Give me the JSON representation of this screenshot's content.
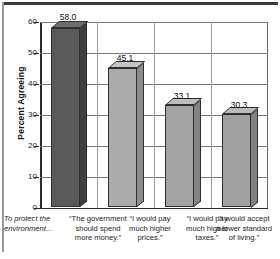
{
  "chart_data": {
    "type": "bar",
    "title": "",
    "xlabel": "",
    "ylabel": "Percent Agreeing",
    "ylim": [
      0,
      60
    ],
    "yticks": [
      0,
      10,
      20,
      30,
      40,
      50,
      60
    ],
    "grid": true,
    "legend": "none",
    "lead_in_label": "To protect the environment…",
    "categories": [
      "“The government should spend more money.”",
      "“I would pay much higher prices.”",
      "“I would pay much higher taxes.”",
      "“I would accept a lower standard of living.”"
    ],
    "category_lines": [
      [
        "“The government",
        "should spend",
        "more money.”"
      ],
      [
        "“I would pay",
        "much higher",
        "prices.”"
      ],
      [
        "“I would pay",
        "much higher",
        "taxes.”"
      ],
      [
        "“I would accept",
        "a lower standard",
        "of living.”"
      ]
    ],
    "lead_in_lines": [
      "To protect the",
      "environment…"
    ],
    "values": [
      58.0,
      45.1,
      33.1,
      30.3
    ],
    "value_labels": [
      "58.0",
      "45.1",
      "33.1",
      "30.3"
    ],
    "bar_colors": [
      "#595959",
      "#ababab",
      "#a3a3a3",
      "#a0a0a0"
    ],
    "bar_top_colors": [
      "#6e6e6e",
      "#c4c4c4",
      "#bdbdbd",
      "#bababa"
    ],
    "bar_side_colors": [
      "#3f3f3f",
      "#8c8c8c",
      "#848484",
      "#818181"
    ]
  },
  "axis": {
    "tick_labels": [
      "60",
      "50",
      "40",
      "30",
      "20",
      "10",
      "0"
    ]
  },
  "colors": {
    "background": "#ffffff",
    "axis": "#2b2b2b",
    "gridline": "#787878",
    "text": "#1a1a1a",
    "top_rule": "#3a3a3a"
  }
}
